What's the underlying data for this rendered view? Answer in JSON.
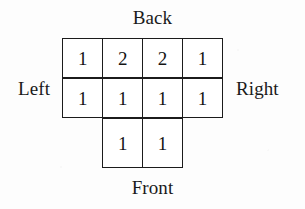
{
  "figure": {
    "title_visible": false,
    "background_color": "#fdfdfd",
    "line_color": "#1b1b1b",
    "text_color": "#141414"
  },
  "labels": {
    "back": "Back",
    "front": "Front",
    "left": "Left",
    "right": "Right"
  },
  "chart_data": {
    "type": "table",
    "title": "",
    "xlabel": "",
    "ylabel": "",
    "orientation_labels": {
      "top": "Back",
      "bottom": "Front",
      "left": "Left",
      "right": "Right"
    },
    "columns": 4,
    "rows": 3,
    "grid": [
      [
        "1",
        "2",
        "2",
        "1"
      ],
      [
        "1",
        "1",
        "1",
        "1"
      ],
      [
        "",
        "1",
        "1",
        ""
      ]
    ],
    "cell_presence": [
      [
        true,
        true,
        true,
        true
      ],
      [
        true,
        true,
        true,
        true
      ],
      [
        false,
        true,
        true,
        false
      ]
    ],
    "values_flat": [
      1,
      2,
      2,
      1,
      1,
      1,
      1,
      1,
      1,
      1
    ],
    "total": 12,
    "grid_on": true,
    "legend": "none"
  }
}
